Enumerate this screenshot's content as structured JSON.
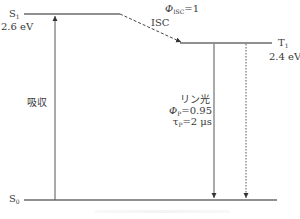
{
  "diagram": {
    "type": "jablonski-energy-diagram",
    "states": [
      {
        "id": "S1",
        "symbol": "S",
        "subscript": "1",
        "energy_label": "2.6 eV"
      },
      {
        "id": "T1",
        "symbol": "T",
        "subscript": "1",
        "energy_label": "2.4 eV"
      },
      {
        "id": "S0",
        "symbol": "S",
        "subscript": "0"
      }
    ],
    "transitions": {
      "absorption": {
        "label": "吸収",
        "from": "S0",
        "to": "S1",
        "style": "solid"
      },
      "isc": {
        "label": "ISC",
        "quantum_yield_symbol": "Φ",
        "quantum_yield_subscript": "ISC",
        "quantum_yield_value": "=1",
        "from": "S1",
        "to": "T1",
        "style": "dashed"
      },
      "phosphorescence": {
        "label": "リン光",
        "yield_symbol": "Φ",
        "yield_subscript": "P",
        "yield_value": "=0.95",
        "lifetime_symbol": "τ",
        "lifetime_subscript": "P",
        "lifetime_value": "=2 μs",
        "from": "T1",
        "to": "S0",
        "style": "solid"
      },
      "nonradiative": {
        "from": "T1",
        "to": "S0",
        "style": "dotted"
      }
    },
    "colors": {
      "line": "#333333",
      "level": "#222222",
      "text": "#3a3a3a"
    }
  }
}
